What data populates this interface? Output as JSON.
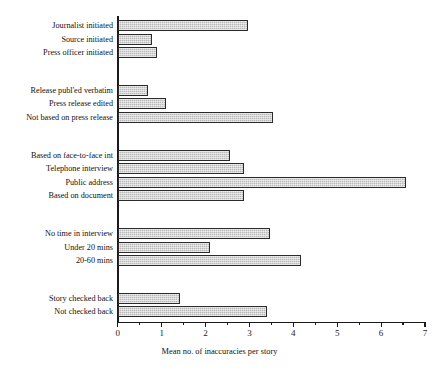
{
  "chart_data": {
    "type": "bar",
    "orientation": "horizontal",
    "title": "",
    "xlabel": "Mean no. of inaccuracies per story",
    "ylabel": "",
    "xlim": [
      0,
      7
    ],
    "xticks": [
      0,
      1,
      2,
      3,
      4,
      5,
      6,
      7
    ],
    "xtick_labels": [
      "0",
      "1",
      "2",
      "3",
      "4",
      "5",
      "6",
      "7"
    ],
    "minor_tick_interval": 0.5,
    "grid": false,
    "legend": false,
    "bar_fill_color": "#b9b9b9",
    "bar_edge_color": "#2b2b2b",
    "axis_color": "#1a1a1a",
    "categories": [
      "Journalist initiated",
      "Source initiated",
      "Press officer initiated",
      "Release publ'ed verbatim",
      "Press release edited",
      "Not based on press release",
      "Based on face-to-face int",
      "Telephone interview",
      "Public address",
      "Based on document",
      "No time in interview",
      "Under 20 mins",
      "20-60 mins",
      "Story checked back",
      "Not checked back"
    ],
    "values": [
      2.97,
      0.77,
      0.89,
      0.68,
      1.09,
      3.53,
      2.55,
      2.87,
      6.57,
      2.88,
      3.46,
      2.1,
      4.17,
      1.41,
      3.39
    ],
    "groups": [
      {
        "name": "Story origin",
        "categories": [
          "Journalist initiated",
          "Source initiated",
          "Press officer initiated"
        ]
      },
      {
        "name": "Press release use",
        "categories": [
          "Release publ'ed verbatim",
          "Press release edited",
          "Not based on press release"
        ]
      },
      {
        "name": "Information source",
        "categories": [
          "Based on face-to-face int",
          "Telephone interview",
          "Public address",
          "Based on document"
        ]
      },
      {
        "name": "Interview length",
        "categories": [
          "No time in interview",
          "Under 20 mins",
          "20-60 mins"
        ]
      },
      {
        "name": "Checking back",
        "categories": [
          "Story checked back",
          "Not checked back"
        ]
      }
    ]
  }
}
